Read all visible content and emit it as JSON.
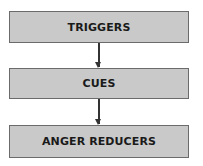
{
  "diagram": {
    "type": "vertical-flowchart",
    "nodes": [
      {
        "id": "triggers",
        "label": "TRIGGERS"
      },
      {
        "id": "cues",
        "label": "CUES"
      },
      {
        "id": "anger-reducers",
        "label": "ANGER REDUCERS"
      }
    ],
    "edges": [
      {
        "from": "triggers",
        "to": "cues"
      },
      {
        "from": "cues",
        "to": "anger-reducers"
      }
    ],
    "colors": {
      "box_fill": "#c9c9c9",
      "box_border": "#6b6b6b",
      "arrow": "#333333",
      "text": "#1a1a1a"
    }
  }
}
